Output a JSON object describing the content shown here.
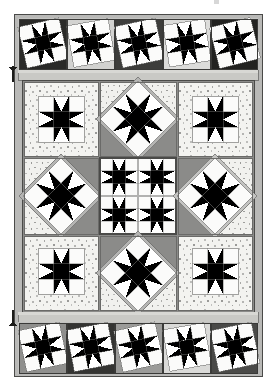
{
  "document": {
    "type": "quilt-pattern-diagram",
    "title": "Sampler Quilt Layout Diagram",
    "orientation": "portrait",
    "caption_fragment": ""
  },
  "canvas": {
    "width": 276,
    "height": 389,
    "background": "#ffffff"
  },
  "palette": {
    "white": "#ffffff",
    "off_white": "#f4f4f2",
    "speckle_bg": "#f2f2ee",
    "speckle_dot": "#9a9a98",
    "light_gray": "#d6d6d4",
    "mid_light_gray": "#bdbdbb",
    "mid_gray": "#a3a3a1",
    "gray": "#8b8b89",
    "dark_gray": "#5c5c5a",
    "charcoal": "#3a3a38",
    "near_black": "#1c1c1a",
    "outline": "#4a4a48"
  },
  "layout": {
    "quilt_frame": {
      "x": 14,
      "y": 14,
      "width": 248,
      "height": 362
    },
    "top_border_strip": {
      "label": "top pieced border",
      "x": 18,
      "y": 18,
      "width": 240,
      "height": 52
    },
    "bottom_border_strip": {
      "label": "bottom pieced border",
      "x": 18,
      "y": 322,
      "width": 240,
      "height": 52
    },
    "inner_sashing_top": {
      "label": "top sashing band",
      "x": 18,
      "y": 70,
      "width": 240,
      "height": 10
    },
    "inner_sashing_bottom": {
      "label": "bottom sashing band",
      "x": 18,
      "y": 312,
      "width": 240,
      "height": 10
    },
    "center_field": {
      "label": "center nine-block field",
      "x": 22,
      "y": 80,
      "width": 232,
      "height": 232
    }
  },
  "border": {
    "block_count_top": 5,
    "block_count_bottom": 5,
    "block_style": "tilted sawtooth star on rectangle",
    "top_blocks": [
      {
        "index": 1,
        "name": "tilted-star-block",
        "tilt_deg": -13,
        "bg": "#2a2a28",
        "star": "#6f6f6d"
      },
      {
        "index": 2,
        "name": "tilted-star-block",
        "tilt_deg": -10,
        "bg": "#cfcfcd",
        "star": "#8b8b89"
      },
      {
        "index": 3,
        "name": "tilted-star-block",
        "tilt_deg": -12,
        "bg": "#3d3d3b",
        "star": "#a3a3a1"
      },
      {
        "index": 4,
        "name": "tilted-star-block",
        "tilt_deg": -9,
        "bg": "#d9d9d7",
        "star": "#5c5c5a"
      },
      {
        "index": 5,
        "name": "tilted-star-block",
        "tilt_deg": -14,
        "bg": "#232321",
        "star": "#9a9a98"
      }
    ],
    "bottom_blocks": [
      {
        "index": 1,
        "name": "tilted-star-block",
        "tilt_deg": -12,
        "bg": "#8f8f8d",
        "star": "#2a2a28"
      },
      {
        "index": 2,
        "name": "tilted-star-block",
        "tilt_deg": -11,
        "bg": "#34343 2",
        "star": "#c9c9c7"
      },
      {
        "index": 3,
        "name": "tilted-star-block",
        "tilt_deg": -13,
        "bg": "#9b9b99",
        "star": "#3a3a38"
      },
      {
        "index": 4,
        "name": "tilted-star-block",
        "tilt_deg": -10,
        "bg": "#dadad8",
        "star": "#1c1c1a"
      },
      {
        "index": 5,
        "name": "tilted-star-block",
        "tilt_deg": -12,
        "bg": "#4a4a48",
        "star": "#bdbdbb"
      }
    ]
  },
  "center_grid": {
    "rows": 3,
    "cols": 3,
    "cells": [
      {
        "pos": "top-left",
        "name": "star-block-plain",
        "setting": "square",
        "bg": "speckle",
        "star_dark": "#2a2a28",
        "star_mid": "#9a9a98"
      },
      {
        "pos": "top-center",
        "name": "star-block-on-point",
        "setting": "on-point",
        "bg": "speckle",
        "star_dark": "#6f6f6d",
        "star_mid": "#bdbdbb"
      },
      {
        "pos": "top-right",
        "name": "star-block-plain",
        "setting": "square",
        "bg": "speckle",
        "star_dark": "#3a3a38",
        "star_mid": "#a3a3a1"
      },
      {
        "pos": "mid-left",
        "name": "star-block-on-point",
        "setting": "on-point",
        "bg": "#8b8b89",
        "star_dark": "#1c1c1a",
        "star_mid": "#c9c9c7"
      },
      {
        "pos": "center",
        "name": "medallion-star-block",
        "setting": "square",
        "bg": "#efefed",
        "star_dark": "#2a2a28",
        "star_mid": "#8b8b89"
      },
      {
        "pos": "mid-right",
        "name": "star-block-on-point",
        "setting": "on-point",
        "bg": "#8b8b89",
        "star_dark": "#bdbdbb",
        "star_mid": "#d6d6d4"
      },
      {
        "pos": "bottom-left",
        "name": "star-block-plain",
        "setting": "square",
        "bg": "speckle",
        "star_dark": "#2a2a28",
        "star_mid": "#a3a3a1"
      },
      {
        "pos": "bottom-center",
        "name": "star-block-on-point",
        "setting": "on-point",
        "bg": "#8b8b89",
        "star_dark": "#4a4a48",
        "star_mid": "#d6d6d4"
      },
      {
        "pos": "bottom-right",
        "name": "star-block-plain",
        "setting": "square",
        "bg": "speckle",
        "star_dark": "#1c1c1a",
        "star_mid": "#9a9a98"
      }
    ]
  },
  "markers": [
    {
      "name": "left-edge-marker-top",
      "x": 12,
      "y": 68,
      "orientation": "vertical-tick"
    },
    {
      "name": "left-edge-marker-bottom",
      "x": 12,
      "y": 312,
      "orientation": "vertical-tick"
    }
  ],
  "artifacts": [
    {
      "name": "top-crop-artifact",
      "x": 214,
      "y": 0,
      "width": 5,
      "height": 5
    }
  ]
}
